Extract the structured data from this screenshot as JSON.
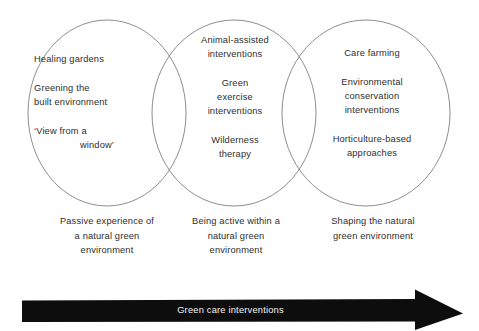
{
  "figure": {
    "type": "venn-diagram",
    "title": "Green care interventions",
    "background_color": "#ffffff",
    "circle_stroke_color": "#8e8e8e",
    "text_color": "#2e2e2e",
    "arrow_color": "#0d0d0d",
    "arrow_label_color": "#f2f2f2"
  },
  "circles": {
    "left": {
      "items": [
        "Healing gardens",
        "Greening the\nbuilt environment",
        "‘View from a\nwindow’"
      ],
      "item_1": "Healing gardens",
      "item_2_line_1": "Greening the",
      "item_2_line_2": "built environment",
      "item_3_line_1": "‘View from a",
      "item_3_line_2": "window’",
      "caption_line_1": "Passive experience of",
      "caption_line_2": "a natural green",
      "caption_line_3": "environment"
    },
    "middle": {
      "items": [
        "Animal-assisted\ninterventions",
        "Green\nexercise\ninterventions",
        "Wilderness\ntherapy"
      ],
      "item_1_line_1": "Animal-assisted",
      "item_1_line_2": "interventions",
      "item_2_line_1": "Green",
      "item_2_line_2": "exercise",
      "item_2_line_3": "interventions",
      "item_3_line_1": "Wilderness",
      "item_3_line_2": "therapy",
      "caption_line_1": "Being active within a",
      "caption_line_2": "natural green",
      "caption_line_3": "environment"
    },
    "right": {
      "items": [
        "Care farming",
        "Environmental\nconservation\ninterventions",
        "Horticulture-based\napproaches"
      ],
      "item_1": "Care farming",
      "item_2_line_1": "Environmental",
      "item_2_line_2": "conservation",
      "item_2_line_3": "interventions",
      "item_3_line_1": "Horticulture-based",
      "item_3_line_2": "approaches",
      "caption_line_1": "Shaping the natural",
      "caption_line_2": "green environment"
    }
  },
  "arrow": {
    "label": "Green care interventions",
    "direction": "right"
  }
}
